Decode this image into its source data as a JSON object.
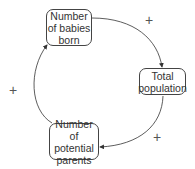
{
  "diagram": {
    "type": "causal-loop",
    "nodes": [
      {
        "id": "babies",
        "label": "Number of babies born"
      },
      {
        "id": "population",
        "label": "Total population"
      },
      {
        "id": "parents",
        "label": "Number of potential parents"
      }
    ],
    "links": [
      {
        "from": "babies",
        "to": "population",
        "polarity": "+"
      },
      {
        "from": "population",
        "to": "parents",
        "polarity": "+"
      },
      {
        "from": "parents",
        "to": "babies",
        "polarity": "+"
      }
    ]
  }
}
